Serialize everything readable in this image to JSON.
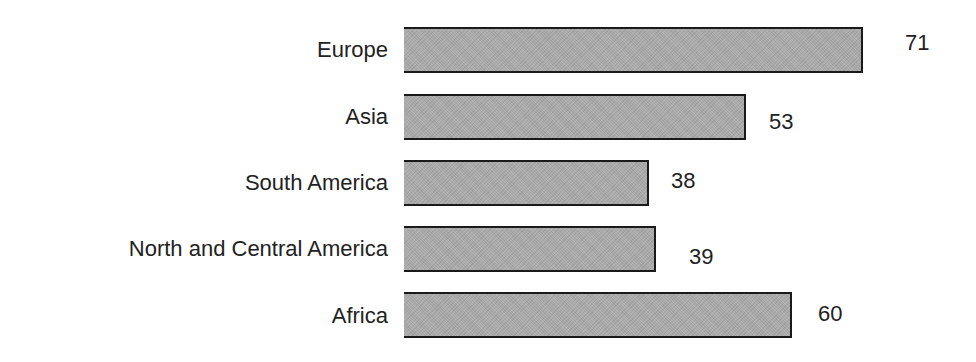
{
  "chart_data": {
    "type": "bar",
    "orientation": "horizontal",
    "title": "",
    "xlabel": "",
    "ylabel": "",
    "categories": [
      "Europe",
      "Asia",
      "South America",
      "North and Central America",
      "Africa"
    ],
    "values": [
      71,
      53,
      38,
      39,
      60
    ],
    "value_labels": [
      "71",
      "53",
      "38",
      "39",
      "60"
    ],
    "xlim": [
      0,
      71
    ],
    "grid": false,
    "legend": null,
    "bar_color": "#a9a9a9",
    "bar_edge_color": "#1a1a1a",
    "text_color": "#222222"
  },
  "layout": {
    "bar_left": 404,
    "px_per_unit": 6.46,
    "rows": [
      {
        "bar_top": 27,
        "bar_height": 46,
        "label_top": 38,
        "value_left": 905,
        "value_top": 31
      },
      {
        "bar_top": 94,
        "bar_height": 46,
        "label_top": 105,
        "value_left": 769,
        "value_top": 110
      },
      {
        "bar_top": 160,
        "bar_height": 46,
        "label_top": 171,
        "value_left": 671,
        "value_top": 169
      },
      {
        "bar_top": 226,
        "bar_height": 46,
        "label_top": 237,
        "value_left": 689,
        "value_top": 245
      },
      {
        "bar_top": 292,
        "bar_height": 46,
        "label_top": 304,
        "value_left": 818,
        "value_top": 302
      }
    ]
  }
}
